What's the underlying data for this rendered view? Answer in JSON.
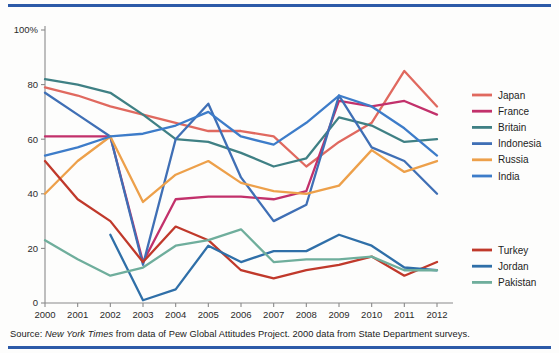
{
  "source": {
    "prefix": "Source:",
    "italic": "New York Times",
    "rest": "from data of Pew Global Attitudes Project. 2000 data from State Department surveys."
  },
  "legend_top": {
    "items": [
      {
        "label": "Japan",
        "color": "#e0695f"
      },
      {
        "label": "France",
        "color": "#c2316b"
      },
      {
        "label": "Britain",
        "color": "#3f8084"
      },
      {
        "label": "Indonesia",
        "color": "#3f6fb5"
      },
      {
        "label": "Russia",
        "color": "#eda04a"
      },
      {
        "label": "India",
        "color": "#3d7cc9"
      }
    ]
  },
  "legend_bottom": {
    "items": [
      {
        "label": "Turkey",
        "color": "#c0392b"
      },
      {
        "label": "Jordan",
        "color": "#2f6fa8"
      },
      {
        "label": "Pakistan",
        "color": "#6fae9c"
      }
    ]
  },
  "chart_data": {
    "type": "line",
    "title": "",
    "xlabel": "",
    "ylabel": "",
    "x": [
      2000,
      2001,
      2002,
      2003,
      2004,
      2005,
      2006,
      2007,
      2008,
      2009,
      2010,
      2011,
      2012
    ],
    "xtick_labels": [
      "2000",
      "2001",
      "2002",
      "2003",
      "2004",
      "2005",
      "2006",
      "2007",
      "2008",
      "2009",
      "2010",
      "2011",
      "2012"
    ],
    "ytick_labels": [
      "0",
      "20",
      "40",
      "60",
      "80",
      "100%"
    ],
    "yticks": [
      0,
      20,
      40,
      60,
      80,
      100
    ],
    "ylim": [
      0,
      100
    ],
    "grid": false,
    "legend_position": "right",
    "series": [
      {
        "name": "Japan",
        "color": "#e0695f",
        "values": [
          79,
          76,
          72,
          69,
          66,
          63,
          63,
          61,
          50,
          59,
          66,
          85,
          72
        ]
      },
      {
        "name": "France",
        "color": "#c2316b",
        "values": [
          61,
          61,
          61,
          15,
          38,
          39,
          39,
          38,
          41,
          74,
          72,
          74,
          69
        ]
      },
      {
        "name": "Britain",
        "color": "#3f8084",
        "values": [
          82,
          80,
          77,
          69,
          60,
          59,
          55,
          50,
          53,
          68,
          65,
          59,
          60
        ]
      },
      {
        "name": "Indonesia",
        "color": "#3f6fb5",
        "values": [
          77,
          69,
          61,
          14,
          60,
          73,
          46,
          30,
          36,
          76,
          57,
          52,
          40
        ]
      },
      {
        "name": "Russia",
        "color": "#eda04a",
        "values": [
          40,
          52,
          61,
          37,
          47,
          52,
          44,
          41,
          40,
          43,
          56,
          48,
          52
        ]
      },
      {
        "name": "India",
        "color": "#3d7cc9",
        "values": [
          54,
          57,
          61,
          62,
          65,
          70,
          61,
          58,
          66,
          76,
          72,
          64,
          54
        ]
      },
      {
        "name": "Turkey",
        "color": "#c0392b",
        "values": [
          52,
          38,
          30,
          15,
          28,
          23,
          12,
          9,
          12,
          14,
          17,
          10,
          15
        ]
      },
      {
        "name": "Jordan",
        "color": "#2f6fa8",
        "values": [
          null,
          null,
          25,
          1,
          5,
          21,
          15,
          19,
          19,
          25,
          21,
          13,
          12
        ]
      },
      {
        "name": "Pakistan",
        "color": "#6fae9c",
        "values": [
          23,
          16,
          10,
          13,
          21,
          23,
          27,
          15,
          16,
          16,
          17,
          12,
          12
        ]
      }
    ]
  },
  "axes": {
    "percent_suffix": "%"
  }
}
